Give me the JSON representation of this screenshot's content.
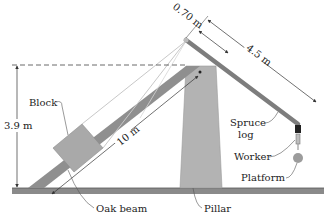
{
  "diagram": {
    "labels": {
      "block": "Block",
      "height": "3.9 m",
      "beam_length": "10 m",
      "short_arm": "0.70 m",
      "long_arm": "4.5 m",
      "spruce_log_line1": "Spruce",
      "spruce_log_line2": "log",
      "worker": "Worker",
      "platform": "Platform",
      "oak_beam": "Oak beam",
      "pillar": "Pillar"
    },
    "colors": {
      "ground": "#8a8a8a",
      "oak_beam": "#8f8f8f",
      "pillar": "#b3b3b3",
      "block": "#a9a9a9",
      "spruce_log": "#7d7d7d",
      "rope": "#c8c8c8",
      "dimension_line": "#333333"
    }
  }
}
